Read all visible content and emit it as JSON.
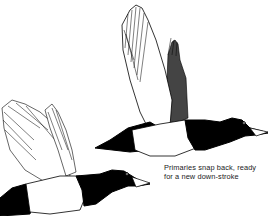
{
  "illustration": {
    "subject": "two diving ducks in flight",
    "ink_color": "#000000",
    "paper_color": "#ffffff"
  },
  "caption": {
    "line1": "Primaries snap back, ready",
    "line2": "for a new down-stroke"
  }
}
